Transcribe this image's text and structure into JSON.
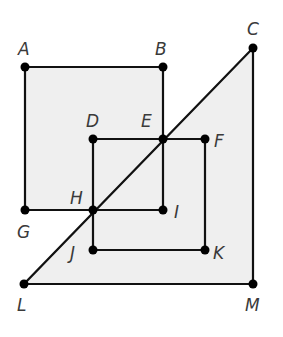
{
  "colors": {
    "background": "#ffffff",
    "fill": "#efefef",
    "stroke": "#111111",
    "label": "#3a3a3a"
  },
  "points": {
    "A": {
      "x": 25,
      "y": 67,
      "label": "A",
      "lx": 18,
      "ly": 55
    },
    "B": {
      "x": 163,
      "y": 67,
      "label": "B",
      "lx": 155,
      "ly": 55
    },
    "C": {
      "x": 253,
      "y": 48,
      "label": "C",
      "lx": 247,
      "ly": 35
    },
    "D": {
      "x": 93,
      "y": 139,
      "label": "D",
      "lx": 86,
      "ly": 127
    },
    "E": {
      "x": 163,
      "y": 139,
      "label": "E",
      "lx": 141,
      "ly": 127
    },
    "F": {
      "x": 205,
      "y": 139,
      "label": "F",
      "lx": 214,
      "ly": 147
    },
    "G": {
      "x": 25,
      "y": 210,
      "label": "G",
      "lx": 17,
      "ly": 238
    },
    "H": {
      "x": 93,
      "y": 210,
      "label": "H",
      "lx": 70,
      "ly": 204
    },
    "I": {
      "x": 163,
      "y": 210,
      "label": "I",
      "lx": 174,
      "ly": 218
    },
    "J": {
      "x": 93,
      "y": 250,
      "label": "J",
      "lx": 70,
      "ly": 259
    },
    "K": {
      "x": 205,
      "y": 250,
      "label": "K",
      "lx": 213,
      "ly": 259
    },
    "L": {
      "x": 24,
      "y": 284,
      "label": "L",
      "lx": 17,
      "ly": 311
    },
    "M": {
      "x": 253,
      "y": 284,
      "label": "M",
      "lx": 245,
      "ly": 311
    }
  },
  "shapes": [
    {
      "name": "square-ABIG",
      "vertices": [
        "A",
        "B",
        "I",
        "G"
      ]
    },
    {
      "name": "square-DFKJ",
      "vertices": [
        "D",
        "F",
        "K",
        "J"
      ]
    },
    {
      "name": "triangle-CLM",
      "vertices": [
        "C",
        "L",
        "M"
      ]
    }
  ]
}
